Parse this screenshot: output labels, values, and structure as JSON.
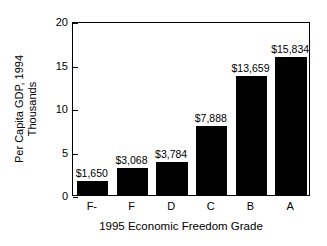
{
  "chart_data": {
    "type": "bar",
    "title": "",
    "subtitle": "",
    "xlabel": "1995 Economic Freedom Grade",
    "ylabel": "Per Capita GDP, 1994 Thousands",
    "ylabel_lines": [
      "Per Capita GDP, 1994",
      "Thousands"
    ],
    "categories": [
      "F-",
      "F",
      "D",
      "C",
      "B",
      "A"
    ],
    "values": [
      1.65,
      3.068,
      3.784,
      7.888,
      13.659,
      15.834
    ],
    "value_labels": [
      "$1,650",
      "$3,068",
      "$3,784",
      "$7,888",
      "$13,659",
      "$15,834"
    ],
    "ylim": [
      0,
      20
    ],
    "yticks": [
      0,
      5,
      10,
      15,
      20
    ],
    "ytick_labels": [
      "0",
      "5",
      "10",
      "15",
      "20"
    ],
    "grid": false,
    "legend": null,
    "bar_color": "#000000",
    "axis_color": "#000000",
    "background_color": "#ffffff",
    "units": "Thousands of US dollars"
  }
}
